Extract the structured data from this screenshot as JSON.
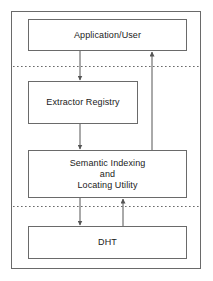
{
  "diagram": {
    "type": "block-architecture-diagram",
    "background_color": "#ffffff",
    "stroke_color": "#555555",
    "text_color": "#1a1a1a",
    "outer_frame": {
      "name": "system-boundary",
      "x": 11,
      "y": 11,
      "width": 190,
      "height": 258
    },
    "nodes": [
      {
        "id": "application-user",
        "lines": [
          "Application/User"
        ],
        "x": 28,
        "y": 19,
        "width": 159,
        "height": 32
      },
      {
        "id": "extractor-registry",
        "lines": [
          "Extractor Registry"
        ],
        "x": 28,
        "y": 81,
        "width": 110,
        "height": 43
      },
      {
        "id": "semantic-indexing-and-locating-utility",
        "lines": [
          "Semantic Indexing",
          "and",
          "Locating Utility"
        ],
        "x": 28,
        "y": 150,
        "width": 159,
        "height": 48
      },
      {
        "id": "dht",
        "lines": [
          "DHT"
        ],
        "x": 28,
        "y": 226,
        "width": 159,
        "height": 33
      }
    ],
    "separators": [
      {
        "id": "separator-upper",
        "y": 66,
        "x1": 13,
        "x2": 199,
        "style": "dotted"
      },
      {
        "id": "separator-lower",
        "y": 206,
        "x1": 13,
        "x2": 199,
        "style": "dotted"
      }
    ],
    "connectors": [
      {
        "id": "application-to-extractor-registry",
        "from": "application-user",
        "to": "extractor-registry",
        "direction": "down",
        "x": 80,
        "y1": 51,
        "y2": 81
      },
      {
        "id": "extractor-registry-to-semantic-indexing",
        "from": "extractor-registry",
        "to": "semantic-indexing-and-locating-utility",
        "direction": "down",
        "x": 80,
        "y1": 124,
        "y2": 150
      },
      {
        "id": "semantic-indexing-to-dht",
        "from": "semantic-indexing-and-locating-utility",
        "to": "dht",
        "direction": "down",
        "x": 80,
        "y1": 198,
        "y2": 226
      },
      {
        "id": "dht-to-semantic-indexing",
        "from": "dht",
        "to": "semantic-indexing-and-locating-utility",
        "direction": "up",
        "x": 123,
        "y1": 226,
        "y2": 198
      },
      {
        "id": "semantic-indexing-to-application",
        "from": "semantic-indexing-and-locating-utility",
        "to": "application-user",
        "direction": "up",
        "x": 152,
        "y1": 150,
        "y2": 51
      }
    ]
  }
}
